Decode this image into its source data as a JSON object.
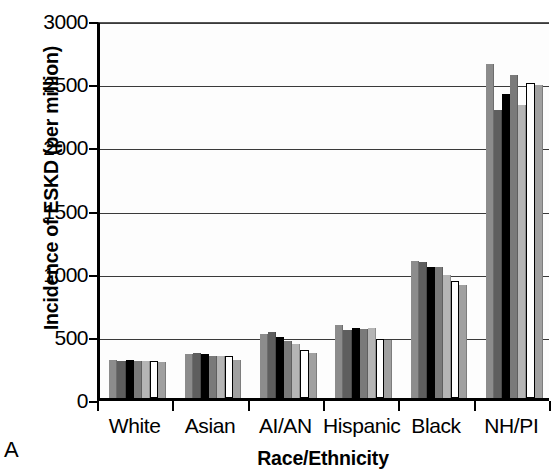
{
  "panel": {
    "label": "A"
  },
  "axes": {
    "ylabel": "Incidence of ESKD (per million)",
    "xlabel": "Race/Ethnicity"
  },
  "chart_data": {
    "type": "bar",
    "title": "",
    "subtitle": "",
    "xlabel": "Race/Ethnicity",
    "ylabel": "Incidence of ESKD (per million)",
    "ylim": [
      0,
      3000
    ],
    "yticks": [
      0,
      500,
      1000,
      1500,
      2000,
      2500,
      3000
    ],
    "ytick_labels": [
      "0",
      "500",
      "1000",
      "1500",
      "2000",
      "2500",
      "3000"
    ],
    "grid": true,
    "legend": "none",
    "categories": [
      "White",
      "Asian",
      "AI/AN",
      "Hispanic",
      "Black",
      "NH/PI"
    ],
    "series": [
      {
        "name": "series-1",
        "color": "#8c8c8c",
        "values": [
          300,
          345,
          510,
          575,
          1085,
          2640
        ]
      },
      {
        "name": "series-2",
        "color": "#5e5e5e",
        "values": [
          290,
          360,
          520,
          540,
          1080,
          2280
        ]
      },
      {
        "name": "series-3",
        "color": "#000000",
        "values": [
          300,
          345,
          480,
          555,
          1040,
          2410
        ]
      },
      {
        "name": "series-4",
        "color": "#7a7a7a",
        "values": [
          295,
          335,
          455,
          550,
          1035,
          2560
        ]
      },
      {
        "name": "series-5",
        "color": "#b5b5b5",
        "values": [
          290,
          330,
          430,
          555,
          975,
          2320
        ]
      },
      {
        "name": "series-6",
        "color": "#ffffff",
        "values": [
          295,
          330,
          380,
          470,
          930,
          2490
        ]
      },
      {
        "name": "series-7",
        "color": "#a0a0a0",
        "values": [
          285,
          300,
          360,
          460,
          895,
          2480
        ]
      }
    ]
  }
}
